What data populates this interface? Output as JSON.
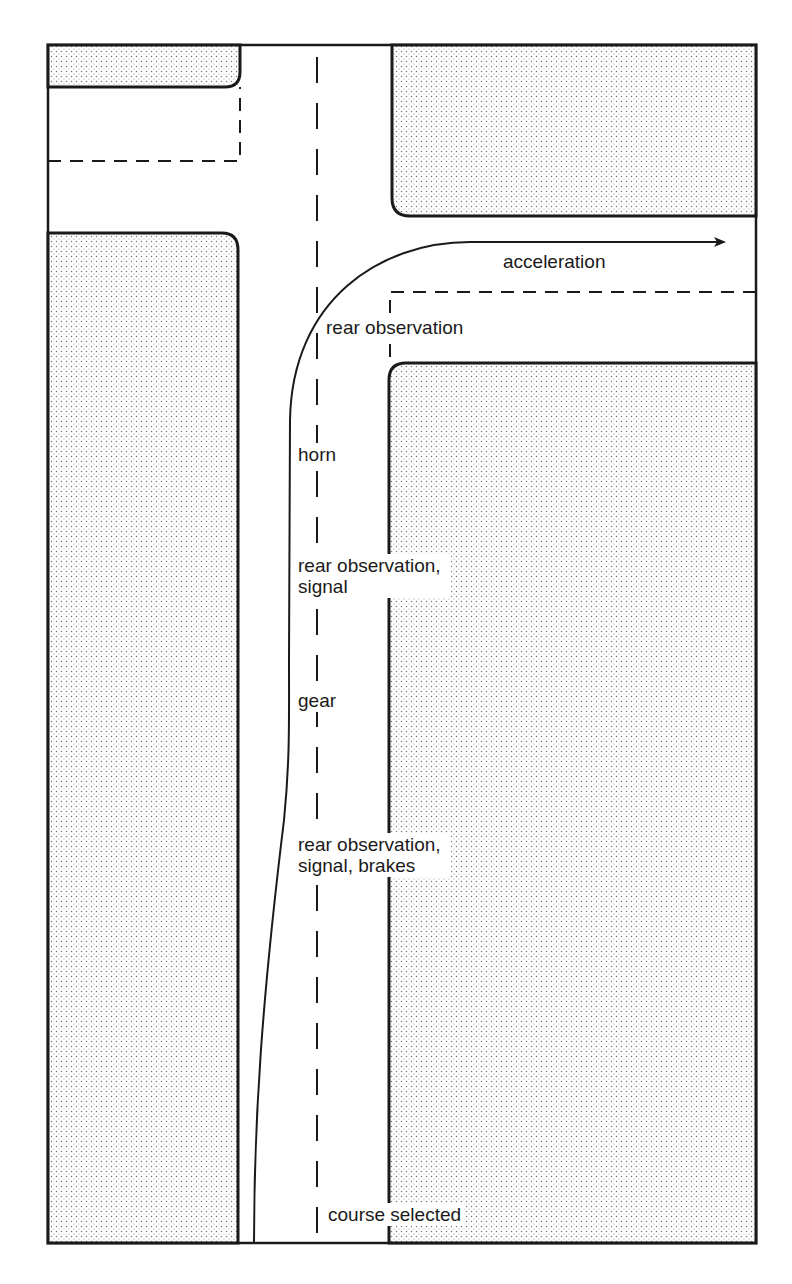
{
  "diagram": {
    "type": "road-junction-manoeuvre",
    "colors": {
      "ink": "#1a1a1a",
      "background": "#ffffff",
      "stipple": "#777777"
    },
    "path": {
      "direction": "from bottom of main road, curving right into side road",
      "end_marker": "arrow-right"
    },
    "labels": {
      "acceleration": "acceleration",
      "rear_observation_top": "rear observation",
      "horn": "horn",
      "rear_observation_signal": "rear observation,\nsignal",
      "gear": "gear",
      "rear_observation_signal_brakes": "rear observation,\nsignal, brakes",
      "course_selected": "course selected"
    },
    "sequence": [
      "course selected",
      "rear observation, signal, brakes",
      "gear",
      "rear observation, signal",
      "horn",
      "rear observation",
      "acceleration"
    ]
  }
}
